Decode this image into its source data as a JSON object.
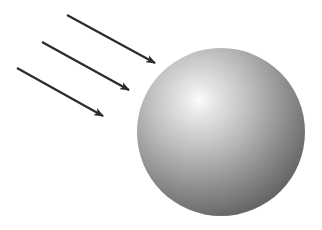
{
  "diagram": {
    "background": "#ffffff",
    "rays": [
      {
        "x1": 67,
        "y1": 15,
        "x2": 155,
        "y2": 63
      },
      {
        "x1": 42,
        "y1": 42,
        "x2": 129,
        "y2": 90
      },
      {
        "x1": 17,
        "y1": 68,
        "x2": 103,
        "y2": 116
      }
    ],
    "ray_color": "#2b2b2b",
    "sphere": {
      "cx": 221,
      "cy": 132,
      "r": 84,
      "highlight_cx": 199,
      "highlight_cy": 100,
      "colors": {
        "highlight": "#fafafa",
        "mid": "#bdbdbd",
        "shadow": "#6a6a6a",
        "rim": "#5a5a5a"
      }
    }
  }
}
